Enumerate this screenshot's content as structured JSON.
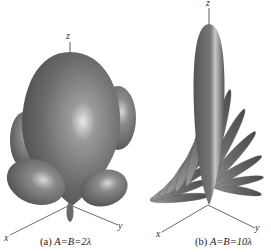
{
  "figure": {
    "panels": [
      {
        "id": "a",
        "caption_label": "(a)",
        "caption_eq": "A=B=2λ",
        "axes": {
          "z": "z",
          "x": "x",
          "y": "y"
        }
      },
      {
        "id": "b",
        "caption_label": "(b)",
        "caption_eq": "A=B=10λ",
        "axes": {
          "z": "z",
          "x": "x",
          "y": "y"
        }
      }
    ]
  }
}
